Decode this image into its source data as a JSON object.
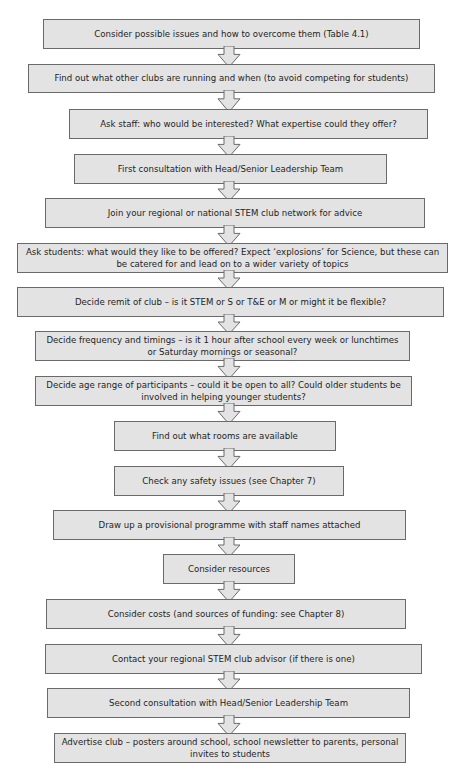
{
  "flowchart": {
    "steps": [
      {
        "text": "Consider possible issues and how to overcome them (Table 4.1)",
        "x": 43,
        "y": 19,
        "w": 377,
        "h": 30
      },
      {
        "text": "Find out what other clubs are running and when (to avoid competing for students)",
        "x": 28,
        "y": 64,
        "w": 407,
        "h": 29
      },
      {
        "text": "Ask staff: who would be interested? What expertise could they offer?",
        "x": 69,
        "y": 109,
        "w": 359,
        "h": 30
      },
      {
        "text": "First consultation with Head/Senior Leadership Team",
        "x": 74,
        "y": 154,
        "w": 313,
        "h": 30
      },
      {
        "text": "Join your regional or national STEM club network for advice",
        "x": 45,
        "y": 198,
        "w": 380,
        "h": 30
      },
      {
        "text": "Ask students: what would they like to be offered? Expect ‘explosions’ for Science, but these can be catered for and lead on to a wider variety of topics",
        "x": 17,
        "y": 243,
        "w": 431,
        "h": 30
      },
      {
        "text": "Decide remit of club – is it STEM or S or T&E or M or might it be flexible?",
        "x": 17,
        "y": 287,
        "w": 427,
        "h": 30
      },
      {
        "text": "Decide frequency and timings – is it 1 hour after school every week or lunchtimes or Saturday mornings or seasonal?",
        "x": 35,
        "y": 331,
        "w": 375,
        "h": 30
      },
      {
        "text": "Decide age range of participants – could it be open to all? Could older students be involved in helping younger students?",
        "x": 35,
        "y": 376,
        "w": 377,
        "h": 30
      },
      {
        "text": "Find out what rooms are available",
        "x": 114,
        "y": 421,
        "w": 222,
        "h": 30
      },
      {
        "text": "Check any safety issues (see Chapter 7)",
        "x": 114,
        "y": 466,
        "w": 230,
        "h": 30
      },
      {
        "text": "Draw up a provisional programme with staff names attached",
        "x": 53,
        "y": 510,
        "w": 353,
        "h": 30
      },
      {
        "text": "Consider resources",
        "x": 163,
        "y": 554,
        "w": 132,
        "h": 30
      },
      {
        "text": "Consider costs (and sources of funding: see Chapter 8)",
        "x": 46,
        "y": 599,
        "w": 360,
        "h": 30
      },
      {
        "text": "Contact your regional STEM club advisor (if there is one)",
        "x": 45,
        "y": 644,
        "w": 377,
        "h": 30
      },
      {
        "text": "Second consultation with Head/Senior Leadership Team",
        "x": 47,
        "y": 688,
        "w": 363,
        "h": 30
      },
      {
        "text": "Advertise club – posters around school, school newsletter to parents, personal invites to students",
        "x": 54,
        "y": 733,
        "w": 352,
        "h": 30
      }
    ],
    "arrow_x": 229,
    "colors": {
      "box_fill": "#e3e3e3",
      "box_border": "#6a6a6a",
      "text": "#1e1e1e"
    }
  }
}
